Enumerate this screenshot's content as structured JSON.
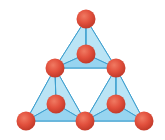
{
  "diagram": {
    "colors": {
      "atom_fill": "#e2503d",
      "atom_highlight": "#f07a62",
      "atom_shadow": "#c23a2a",
      "face_light": "#d7f0fa",
      "face_mid": "#b6e2f4",
      "face_dark": "#8fd0ee",
      "edge": "#3d9fcf"
    },
    "atom_radius": 9.5,
    "atoms": [
      {
        "id": "a1",
        "x": 86,
        "y": 19
      },
      {
        "id": "a2",
        "x": 86,
        "y": 54
      },
      {
        "id": "a3",
        "x": 55,
        "y": 68
      },
      {
        "id": "a4",
        "x": 116,
        "y": 68
      },
      {
        "id": "a5",
        "x": 56,
        "y": 104
      },
      {
        "id": "a6",
        "x": 116,
        "y": 104
      },
      {
        "id": "a7",
        "x": 26,
        "y": 121
      },
      {
        "id": "a8",
        "x": 85,
        "y": 121
      },
      {
        "id": "a9",
        "x": 144,
        "y": 121
      }
    ],
    "tetrahedra": [
      {
        "apex": "a1",
        "inner": "a2",
        "base_left": "a3",
        "base_right": "a4"
      },
      {
        "apex": "a3",
        "inner": "a5",
        "base_left": "a7",
        "base_right": "a8"
      },
      {
        "apex": "a4",
        "inner": "a6",
        "base_left": "a8",
        "base_right": "a9"
      }
    ]
  }
}
